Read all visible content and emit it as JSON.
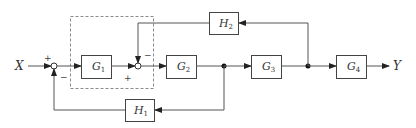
{
  "diagram": {
    "type": "block-diagram",
    "input_label": "X",
    "output_label": "Y",
    "blocks": [
      {
        "id": "G1",
        "name": "G",
        "sub": "1"
      },
      {
        "id": "G2",
        "name": "G",
        "sub": "2"
      },
      {
        "id": "G3",
        "name": "G",
        "sub": "3"
      },
      {
        "id": "G4",
        "name": "G",
        "sub": "4"
      },
      {
        "id": "H1",
        "name": "H",
        "sub": "1"
      },
      {
        "id": "H2",
        "name": "H",
        "sub": "2"
      }
    ],
    "summing_junctions": [
      {
        "id": "S1",
        "signs": {
          "input": "+",
          "feedback": "−"
        }
      },
      {
        "id": "S2",
        "signs": {
          "input": "+",
          "feedback": "−"
        }
      }
    ],
    "connections": [
      "X → S1(+)",
      "S1 → G1",
      "G1 → S2(+)",
      "S2 → G2",
      "G2 → branch1",
      "branch1 → G3",
      "branch1 → H1 → S1(−)",
      "G3 → branch2",
      "branch2 → G4 → Y",
      "branch2 → H2 → S2(−)"
    ],
    "colors": {
      "line": "#555555",
      "dashed_box": "#888888",
      "block_border": "#444444"
    }
  }
}
